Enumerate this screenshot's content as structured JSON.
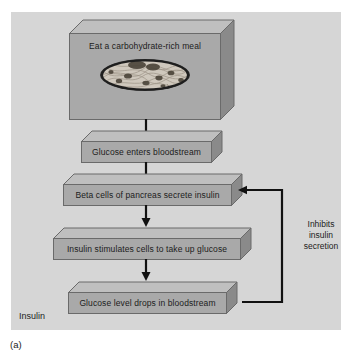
{
  "figure": {
    "caption": "(a)",
    "corner_label": "Insulin",
    "panel_color": "#d6d6d6",
    "box_face_color": "#a9a9a9",
    "box_top_color": "#bfbfbf",
    "box_side_color": "#8a8a8a",
    "outline_color": "#6a6a6a"
  },
  "flow": {
    "steps": [
      {
        "id": "meal",
        "label": "Eat a carbohydrate-rich meal",
        "illustration": "plate-of-pasta-illustration"
      },
      {
        "id": "glucose-enters",
        "label": "Glucose enters bloodstream"
      },
      {
        "id": "beta-cells",
        "label": "Beta cells of pancreas secrete insulin"
      },
      {
        "id": "insulin-stimulates",
        "label": "Insulin stimulates cells to take up glucose"
      },
      {
        "id": "glucose-drops",
        "label": "Glucose level drops in bloodstream"
      }
    ],
    "feedback": {
      "label_lines": [
        "Inhibits",
        "insulin",
        "secretion"
      ],
      "from": "glucose-drops",
      "to": "beta-cells"
    }
  }
}
